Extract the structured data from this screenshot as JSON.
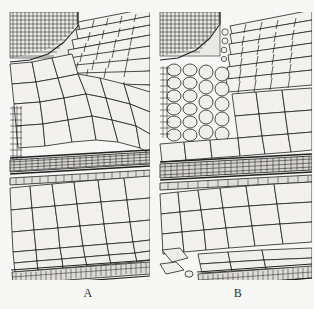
{
  "figure": {
    "kind": "botanical-line-drawing",
    "background_color": "#f8f8f7",
    "ink_color": "#1e1e1e",
    "cell_fill_color": "#f2f1ee",
    "panels": [
      {
        "id": "A",
        "caption": "A",
        "regions": [
          {
            "name": "apical-meristem-block",
            "label": "dense small-celled apex, upper left"
          },
          {
            "name": "diagonal-cell-rows",
            "label": "elongated cells sweeping up to the right"
          },
          {
            "name": "growth-ring-band",
            "label": "dark band of flattened cells across mid panel"
          },
          {
            "name": "polygonal-parenchyma",
            "label": "large rounded cells below the band"
          },
          {
            "name": "basal-dense-band",
            "label": "thin band of small cells near the base"
          }
        ]
      },
      {
        "id": "B",
        "caption": "B",
        "regions": [
          {
            "name": "apical-meristem-block",
            "label": "dense small-celled apex, upper left"
          },
          {
            "name": "apex-cleft",
            "label": "vertical gap splitting apex from the diagonal tissue"
          },
          {
            "name": "diagonal-cell-rows",
            "label": "elongated cells sweeping up to the right"
          },
          {
            "name": "vertical-cell-files",
            "label": "column of stacked oval cells left of centre"
          },
          {
            "name": "growth-ring-band",
            "label": "dark band of flattened cells across mid panel"
          },
          {
            "name": "polygonal-parenchyma",
            "label": "large rounded cells below the band"
          },
          {
            "name": "basal-dense-band",
            "label": "thin band of small cells near the base"
          },
          {
            "name": "protruding-cell",
            "label": "single cell projecting at lower left"
          }
        ]
      }
    ]
  }
}
